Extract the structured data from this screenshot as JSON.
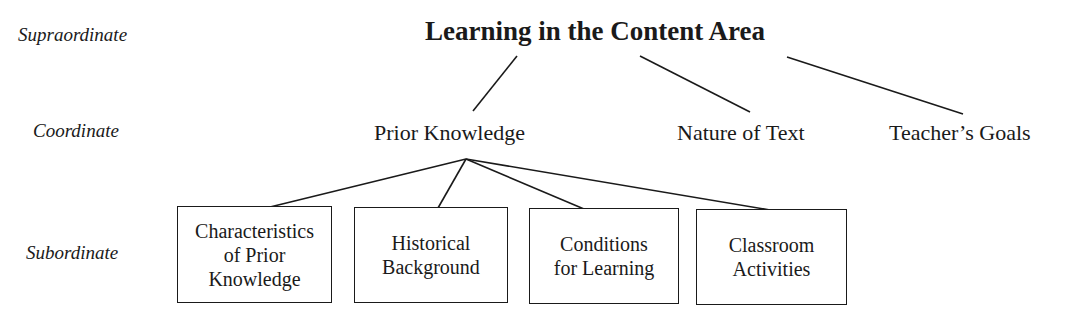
{
  "levels": {
    "supraordinate": "Supraordinate",
    "coordinate": "Coordinate",
    "subordinate": "Subordinate"
  },
  "root": {
    "label": "Learning in the Content Area"
  },
  "coordinates": [
    {
      "label": "Prior Knowledge"
    },
    {
      "label": "Nature of Text"
    },
    {
      "label": "Teacher’s Goals"
    }
  ],
  "subordinates": [
    {
      "lines": [
        "Characteristics",
        "of Prior",
        "Knowledge"
      ]
    },
    {
      "lines": [
        "Historical",
        "Background"
      ]
    },
    {
      "lines": [
        "Conditions",
        "for Learning"
      ]
    },
    {
      "lines": [
        "Classroom",
        "Activities"
      ]
    }
  ],
  "colors": {
    "ink": "#1a1a1a",
    "background": "#ffffff"
  }
}
